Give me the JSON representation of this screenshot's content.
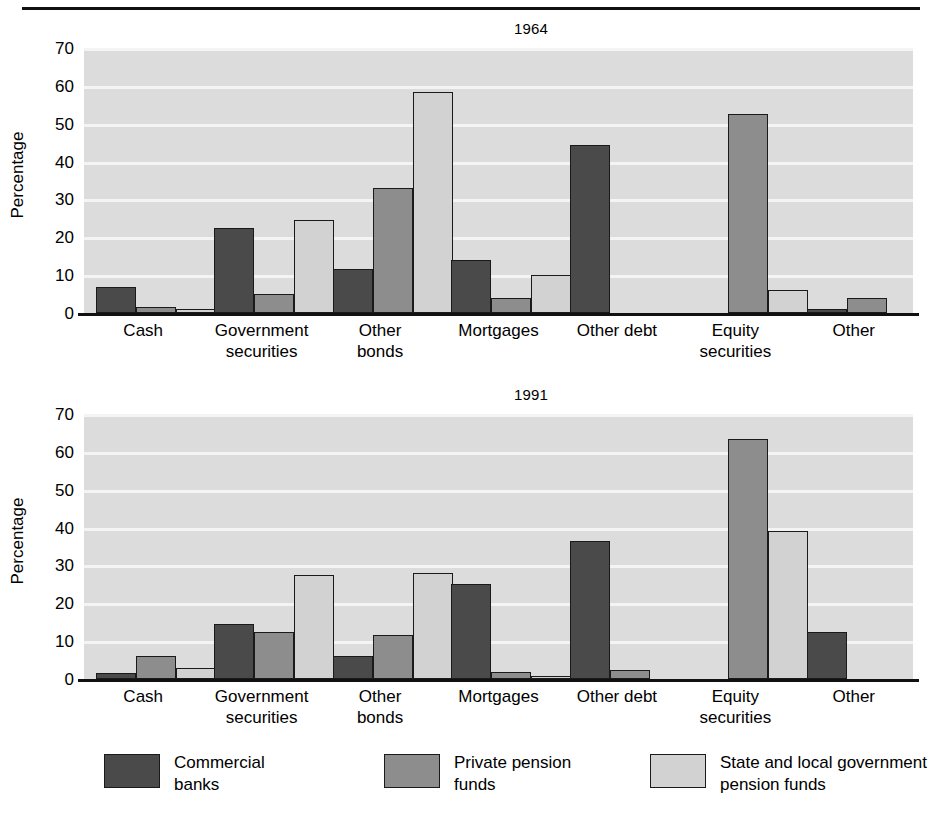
{
  "figure": {
    "ylabel": "Percentage",
    "series": [
      {
        "key": "commercial_banks",
        "label": "Commercial\nbanks",
        "color": "#4a4a4a"
      },
      {
        "key": "private_pension_funds",
        "label": "Private pension\nfunds",
        "color": "#8d8d8d"
      },
      {
        "key": "state_local_pension_funds",
        "label": "State and local government\npension funds",
        "color": "#d2d2d2"
      }
    ],
    "yticks": [
      70,
      60,
      50,
      40,
      30,
      20,
      10,
      0
    ],
    "categories": [
      "Cash",
      "Government\nsecurities",
      "Other\nbonds",
      "Mortgages",
      "Other debt",
      "Equity\nsecurities",
      "Other"
    ]
  },
  "chart_data": [
    {
      "type": "bar",
      "title": "1964",
      "xlabel": "",
      "ylabel": "Percentage",
      "ylim": [
        0,
        70
      ],
      "yticks": [
        0,
        10,
        20,
        30,
        40,
        50,
        60,
        70
      ],
      "grid": true,
      "legend_position": "bottom",
      "categories": [
        "Cash",
        "Government securities",
        "Other bonds",
        "Mortgages",
        "Other debt",
        "Equity securities",
        "Other"
      ],
      "series": [
        {
          "name": "Commercial banks",
          "values": [
            7.0,
            22.5,
            11.5,
            14.0,
            44.5,
            0,
            1.0
          ]
        },
        {
          "name": "Private pension funds",
          "values": [
            1.5,
            5.0,
            33.0,
            4.0,
            0,
            52.5,
            4.0
          ]
        },
        {
          "name": "State and local government pension funds",
          "values": [
            1.0,
            24.5,
            58.5,
            10.0,
            0,
            6.0,
            0
          ]
        }
      ]
    },
    {
      "type": "bar",
      "title": "1991",
      "xlabel": "",
      "ylabel": "Percentage",
      "ylim": [
        0,
        70
      ],
      "yticks": [
        0,
        10,
        20,
        30,
        40,
        50,
        60,
        70
      ],
      "grid": true,
      "legend_position": "bottom",
      "categories": [
        "Cash",
        "Government securities",
        "Other bonds",
        "Mortgages",
        "Other debt",
        "Equity securities",
        "Other"
      ],
      "series": [
        {
          "name": "Commercial banks",
          "values": [
            1.5,
            14.5,
            6.0,
            25.0,
            36.5,
            0,
            12.5
          ]
        },
        {
          "name": "Private pension funds",
          "values": [
            6.0,
            12.5,
            11.5,
            1.8,
            2.5,
            63.5,
            0
          ]
        },
        {
          "name": "State and local government pension funds",
          "values": [
            3.0,
            27.5,
            28.0,
            0.4,
            0,
            39.0,
            0
          ]
        }
      ]
    }
  ]
}
